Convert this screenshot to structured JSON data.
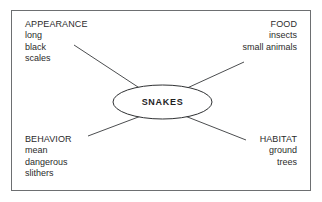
{
  "diagram": {
    "type": "concept-web",
    "center": {
      "label": "SNAKES"
    },
    "branches": [
      {
        "id": "appearance",
        "heading": "APPEARANCE",
        "align": "left",
        "details": [
          "long",
          "black",
          "scales"
        ]
      },
      {
        "id": "food",
        "heading": "FOOD",
        "align": "right",
        "details": [
          "insects",
          "small animals"
        ]
      },
      {
        "id": "behavior",
        "heading": "BEHAVIOR",
        "align": "left",
        "details": [
          "mean",
          "dangerous",
          "slithers"
        ]
      },
      {
        "id": "habitat",
        "heading": "HABITAT",
        "align": "right",
        "details": [
          "ground",
          "trees"
        ]
      }
    ],
    "colors": {
      "background": "#ffffff",
      "frame_border": "#6d6f71",
      "line": "#4c4e50",
      "ellipse_stroke": "#2f3133",
      "text": "#2b2b2b",
      "center_text": "#1f1f1f"
    }
  }
}
